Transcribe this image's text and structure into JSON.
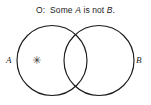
{
  "figure": {
    "name": "venn-diagram-o-proposition",
    "background_color": "#ffffff",
    "stroke_color": "#1a1a1a",
    "text_color": "#1c1c1c"
  },
  "caption": {
    "prefix": "O:",
    "spacer": "  ",
    "word_some": "Some ",
    "term_a": "A",
    "word_is_not": " is not ",
    "term_b": "B",
    "period": ".",
    "full_text": "O:  Some A is not B."
  },
  "diagram": {
    "left_circle_label": "A",
    "right_circle_label": "B",
    "mark_glyph": "✳",
    "mark_name": "asterisk-mark",
    "mark_region": "A-only",
    "left_circle": {
      "cx": 52,
      "cy": 60.5,
      "r": 35
    },
    "right_circle": {
      "cx": 99,
      "cy": 60.5,
      "r": 35
    }
  }
}
